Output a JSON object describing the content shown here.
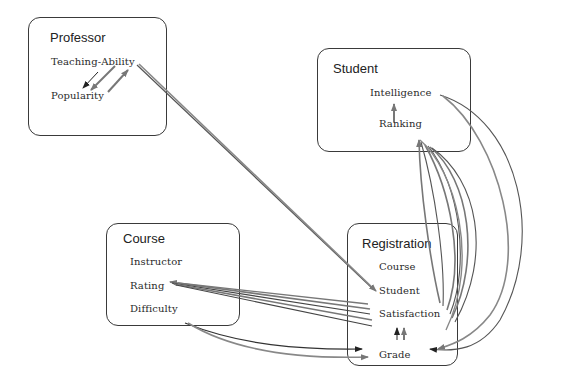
{
  "diagram": {
    "type": "probabilistic-relational-model",
    "colors": {
      "box_border": "#3a3a3a",
      "edge_gray": "#7a7a7a",
      "edge_dark": "#333333",
      "text": "#222222"
    },
    "classes": [
      {
        "name": "Professor",
        "attributes": [
          "Teaching-Ability",
          "Popularity"
        ]
      },
      {
        "name": "Student",
        "attributes": [
          "Intelligence",
          "Ranking"
        ]
      },
      {
        "name": "Course",
        "attributes": [
          "Instructor",
          "Rating",
          "Difficulty"
        ]
      },
      {
        "name": "Registration",
        "attributes": [
          "Course",
          "Student",
          "Satisfaction",
          "Grade"
        ]
      }
    ],
    "edges": [
      {
        "from": "Professor.Teaching-Ability",
        "to": "Professor.Popularity"
      },
      {
        "from": "Professor.Teaching-Ability",
        "to": "Registration.Student"
      },
      {
        "from": "Student.Intelligence",
        "to": "Registration.Grade"
      },
      {
        "from": "Registration.Grade",
        "to": "Student.Ranking"
      },
      {
        "from": "Registration.Satisfaction",
        "to": "Course.Rating"
      },
      {
        "from": "Course.Difficulty",
        "to": "Registration.Grade"
      },
      {
        "from": "Registration.Grade",
        "to": "Registration.Satisfaction"
      }
    ]
  }
}
